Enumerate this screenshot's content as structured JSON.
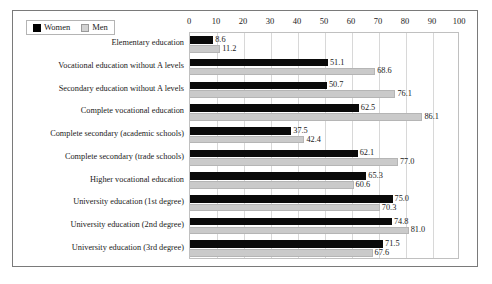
{
  "chart_data": {
    "type": "bar",
    "orientation": "horizontal",
    "title": "",
    "xlabel": "",
    "ylabel": "",
    "xlim": [
      0,
      100
    ],
    "xticks": [
      0,
      10,
      20,
      30,
      40,
      50,
      60,
      70,
      80,
      90,
      100
    ],
    "grid": true,
    "legend_position": "top-left",
    "categories": [
      "Elementary education",
      "Vocational education without A levels",
      "Secondary education without A levels",
      "Complete vocational education",
      "Complete secondary (academic schools)",
      "Complete secondary (trade schools)",
      "Higher vocational education",
      "University education (1st degree)",
      "University education (2nd degree)",
      "University education (3rd degree)"
    ],
    "series": [
      {
        "name": "Women",
        "color": "#0a0a0a",
        "values": [
          8.6,
          51.1,
          50.7,
          62.5,
          37.5,
          62.1,
          65.3,
          75.0,
          74.8,
          71.5
        ],
        "labels": [
          "8.6",
          "51.1",
          "50.7",
          "62.5",
          "37.5",
          "62.1",
          "65.3",
          "75.0",
          "74.8",
          "71.5"
        ]
      },
      {
        "name": "Men",
        "color": "#cacaca",
        "values": [
          11.2,
          68.6,
          76.1,
          86.1,
          42.4,
          77.0,
          60.6,
          70.3,
          81.0,
          67.6
        ],
        "labels": [
          "11.2",
          "68.6",
          "76.1",
          "86.1",
          "42.4",
          "77.0",
          "60.6",
          "70.3",
          "81.0",
          "67.6"
        ]
      }
    ]
  },
  "legend": {
    "items": [
      {
        "label": "Women",
        "swatch": "black-square-icon"
      },
      {
        "label": "Men",
        "swatch": "gray-square-icon"
      }
    ]
  }
}
